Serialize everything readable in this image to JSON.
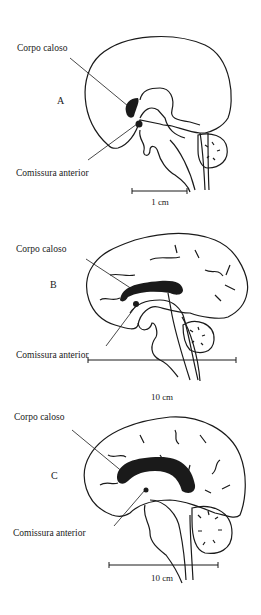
{
  "figure": {
    "panels": [
      {
        "id": "A",
        "letter": "A",
        "label_corpus": "Corpo caloso",
        "label_commissure": "Comissura anterior",
        "scale_label": "1 cm"
      },
      {
        "id": "B",
        "letter": "B",
        "label_corpus": "Corpo caloso",
        "label_commissure": "Comissura anterior",
        "scale_label": "10 cm"
      },
      {
        "id": "C",
        "letter": "C",
        "label_corpus": "Corpo caloso",
        "label_commissure": "Comissura anterior",
        "scale_label": "10 cm"
      }
    ],
    "colors": {
      "ink": "#1a1a1a",
      "background": "#ffffff"
    }
  }
}
